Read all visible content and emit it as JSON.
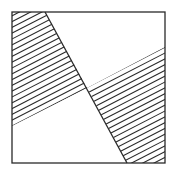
{
  "figure": {
    "stroke_color": "#2a2a2a",
    "background": "#ffffff",
    "square": {
      "x": 12,
      "y": 12,
      "width": 153,
      "height": 151
    },
    "steep_line": {
      "x1": 45,
      "y1": 12,
      "x2": 127,
      "y2": 163
    },
    "shallow_line": {
      "x1": 12,
      "y1": 126,
      "x2": 165,
      "y2": 47
    },
    "intersection": {
      "x": 87,
      "y": 88
    },
    "hatched_regions": [
      {
        "name": "upper-left",
        "points": "12,12 45,12 87,88 12,126"
      },
      {
        "name": "lower-right",
        "points": "87,88 165,47 165,163 127,163"
      }
    ],
    "hatch": {
      "slope": -0.515,
      "spacing": 5.8,
      "stroke_width": 1.1
    }
  }
}
